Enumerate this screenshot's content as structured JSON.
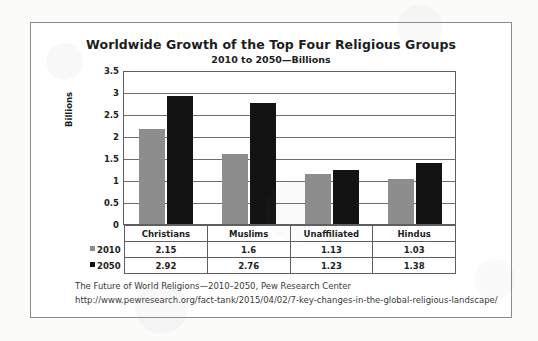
{
  "chart_data": {
    "type": "bar",
    "title": "Worldwide Growth of the Top Four Religious Groups",
    "subtitle": "2010 to 2050—Billions",
    "xlabel": "",
    "ylabel": "Billions",
    "ylim": [
      0,
      3.5
    ],
    "yticks": [
      "0",
      "0.5",
      "1",
      "1.5",
      "2",
      "2.5",
      "3",
      "3.5"
    ],
    "grid": true,
    "legend_position": "table-left",
    "categories": [
      "Christians",
      "Muslims",
      "Unaffiliated",
      "Hindus"
    ],
    "series": [
      {
        "name": "2010",
        "color": "#8d8d8d",
        "values": [
          2.15,
          1.6,
          1.13,
          1.03
        ],
        "labels": [
          "2.15",
          "1.6",
          "1.13",
          "1.03"
        ]
      },
      {
        "name": "2050",
        "color": "#131313",
        "values": [
          2.92,
          2.76,
          1.23,
          1.38
        ],
        "labels": [
          "2.92",
          "2.76",
          "1.23",
          "1.38"
        ]
      }
    ]
  },
  "footer": {
    "line1": "The Future of World Religions—2010–2050, Pew Research Center",
    "line2": "http://www.pewresearch.org/fact-tank/2015/04/02/7-key-changes-in-the-global-religious-landscape/"
  }
}
